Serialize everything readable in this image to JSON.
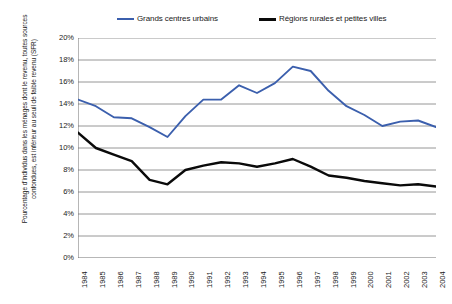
{
  "chart_data": {
    "type": "line",
    "title": "",
    "subtitle": "",
    "xlabel": "",
    "ylabel": "Pourcentage d'individus dans les ménages dont le revenu, toutes sources confondues, est inférieur au seuil de faible revenu (SFR)",
    "x": [
      1984,
      1985,
      1986,
      1987,
      1988,
      1989,
      1990,
      1991,
      1992,
      1993,
      1994,
      1995,
      1996,
      1997,
      1998,
      1999,
      2000,
      2001,
      2002,
      2003,
      2004
    ],
    "xtick_labels": [
      "1984",
      "1985",
      "1986",
      "1987",
      "1988",
      "1989",
      "1990",
      "1991",
      "1992",
      "1993",
      "1994",
      "1995",
      "1996",
      "1997",
      "1998",
      "1999",
      "2000",
      "2001",
      "2002",
      "2003",
      "2004"
    ],
    "ytick_labels": [
      "0%",
      "2%",
      "4%",
      "6%",
      "8%",
      "10%",
      "12%",
      "14%",
      "16%",
      "18%",
      "20%"
    ],
    "ytick_values": [
      0,
      2,
      4,
      6,
      8,
      10,
      12,
      14,
      16,
      18,
      20
    ],
    "ylim": [
      0,
      20
    ],
    "xlim": [
      1984,
      2004
    ],
    "grid": "horizontal",
    "legend_position": "top",
    "series": [
      {
        "name": "Grands centres urbains",
        "color": "#3b5fad",
        "values": [
          14.4,
          13.8,
          12.8,
          12.7,
          11.9,
          11.0,
          12.9,
          14.4,
          14.4,
          15.7,
          15.0,
          15.9,
          17.4,
          17.0,
          15.2,
          13.8,
          13.0,
          12.0,
          12.4,
          12.5,
          11.9
        ]
      },
      {
        "name": "Régions rurales et petites villes",
        "color": "#0a0a0a",
        "values": [
          11.4,
          10.0,
          9.4,
          8.8,
          7.1,
          6.7,
          8.0,
          8.4,
          8.7,
          8.6,
          8.3,
          8.6,
          9.0,
          8.3,
          7.5,
          7.3,
          7.0,
          6.8,
          6.6,
          6.7,
          6.5
        ]
      }
    ]
  },
  "legend": {
    "items": [
      {
        "label": "Grands centres urbains",
        "color": "#3b5fad"
      },
      {
        "label": "Régions rurales et petites villes",
        "color": "#0a0a0a"
      }
    ]
  },
  "axis": {
    "y_title_line1": "Pourcentage d'individus dans les ménages dont le revenu, toutes sources",
    "y_title_line2": "confondues, est inférieur au seuil de faible revenu (SFR)"
  },
  "colors": {
    "urban_line": "#3b5fad",
    "rural_line": "#0a0a0a",
    "gridline": "#8a8a8a",
    "axis": "#6e6e6e",
    "background": "#ffffff"
  }
}
